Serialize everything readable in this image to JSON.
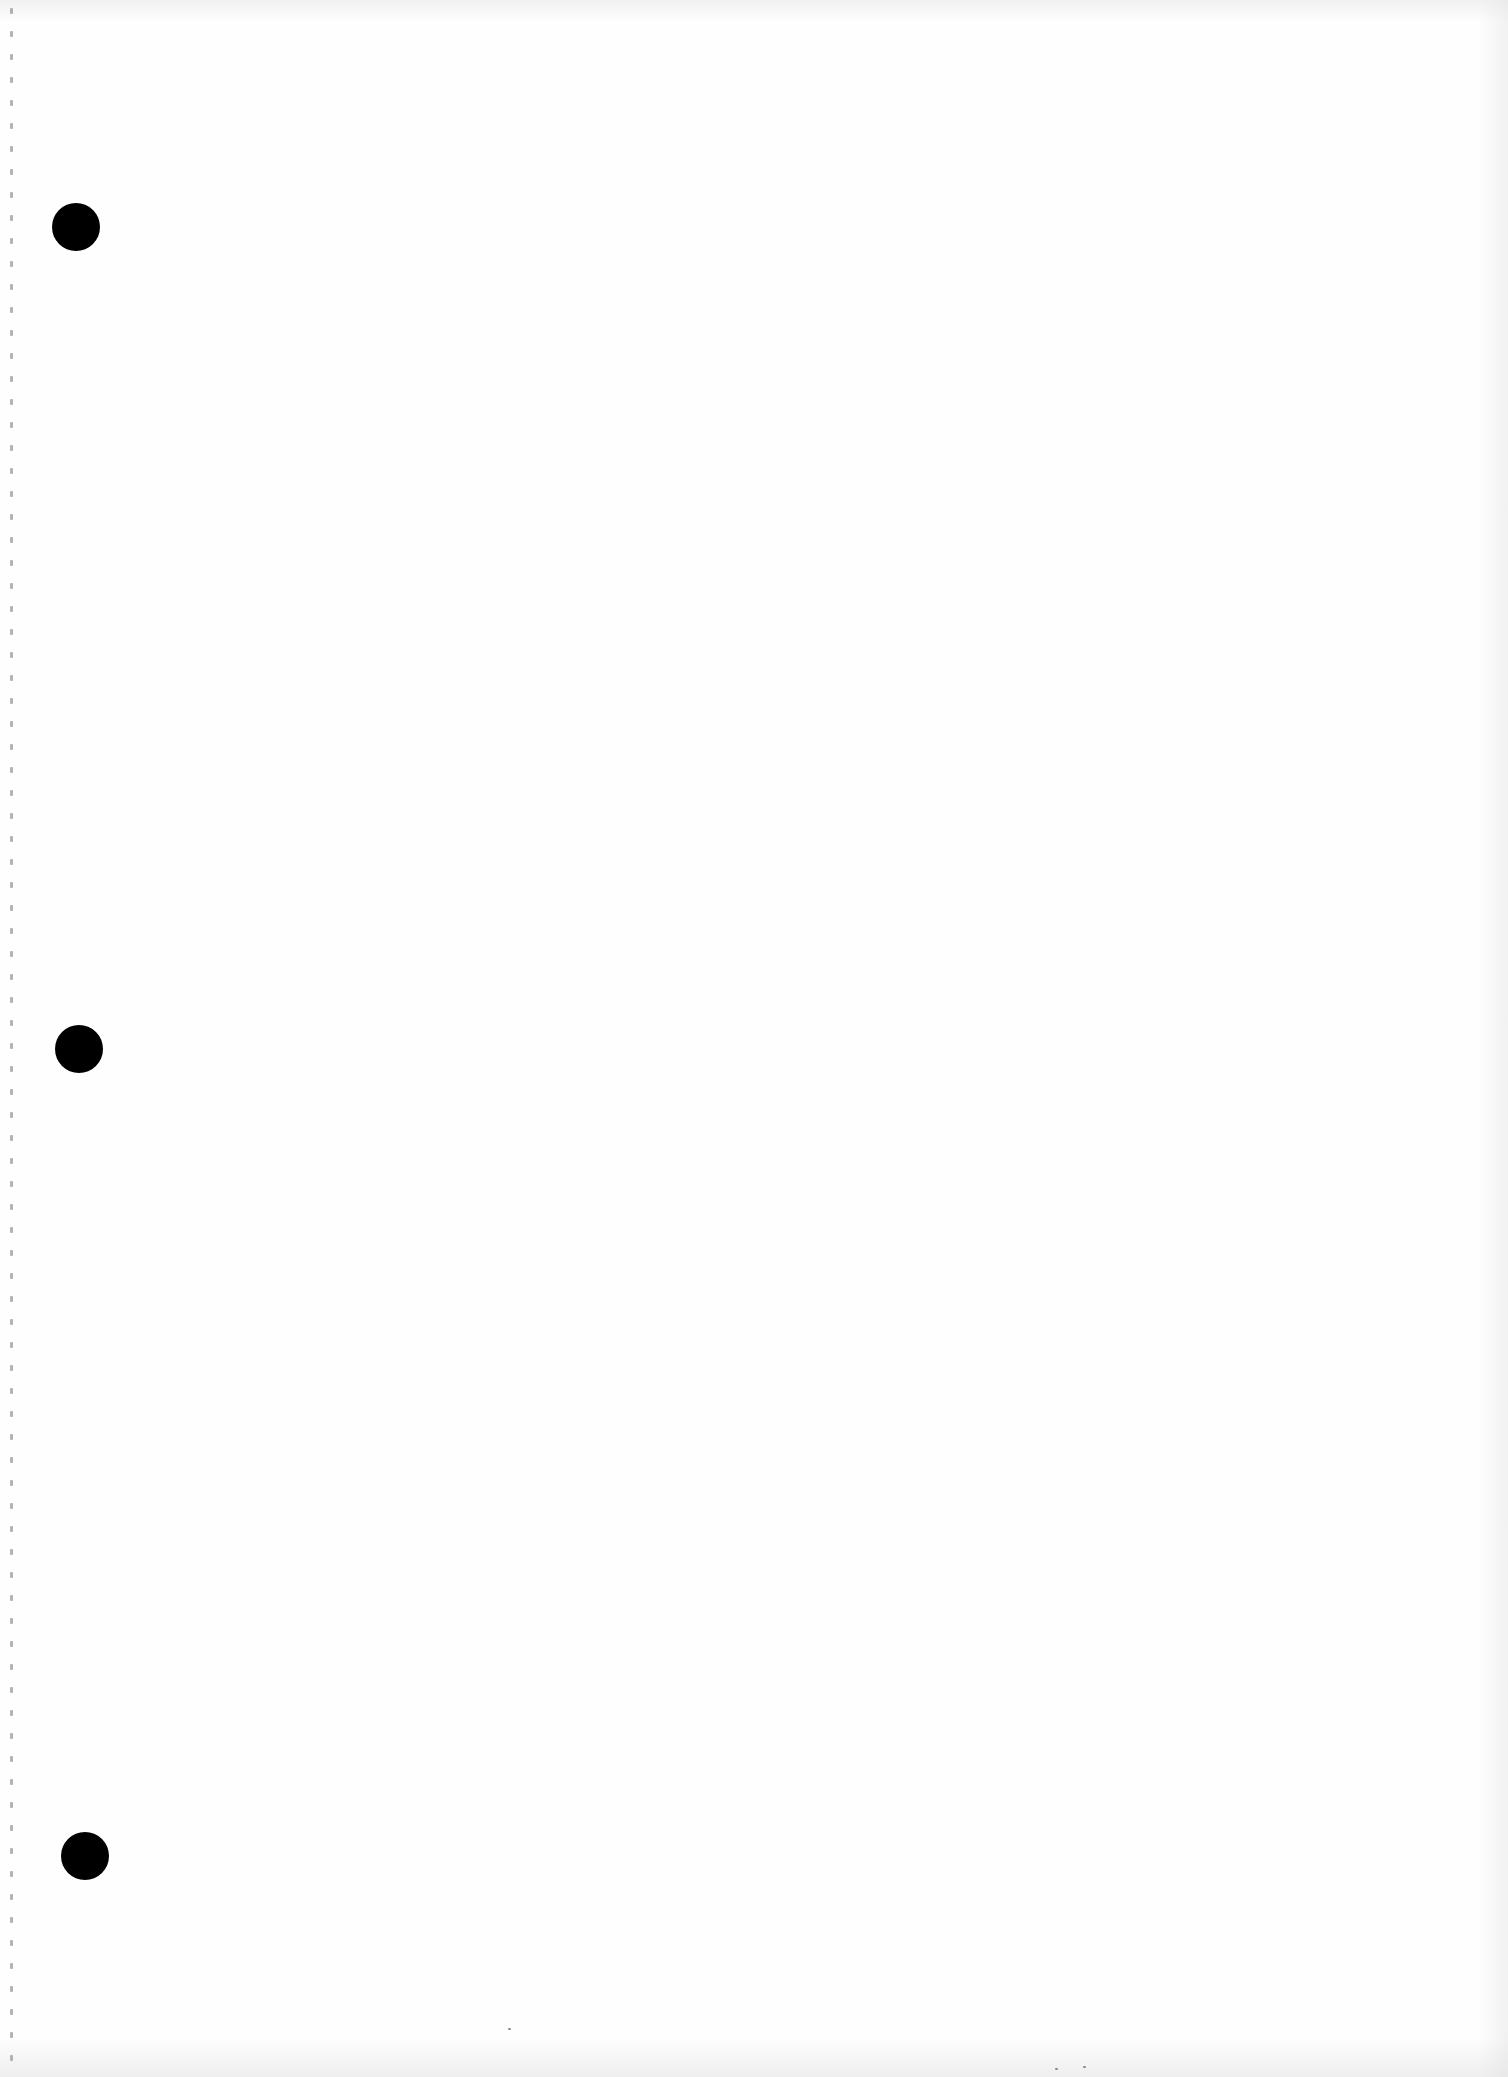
{
  "document": {
    "type": "blank loose-leaf paper scan",
    "background_color": "#fefefe",
    "text": "",
    "punch_holes": [
      {
        "cx": 76,
        "cy": 227,
        "r": 24,
        "color": "#000000"
      },
      {
        "cx": 79,
        "cy": 1049,
        "r": 24,
        "color": "#000000"
      },
      {
        "cx": 85,
        "cy": 1856,
        "r": 24,
        "color": "#000000"
      }
    ],
    "perforation": {
      "x": 11,
      "spacing": 23,
      "color": "#9a9a9a"
    }
  }
}
